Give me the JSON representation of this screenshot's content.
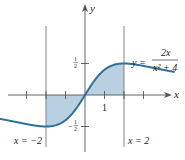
{
  "chart_data": {
    "type": "line",
    "title": "",
    "function": "y = 2x / (x^2 + 4)",
    "xlabel": "x",
    "ylabel": "y",
    "xlim": [
      -4.4,
      4.6
    ],
    "ylim": [
      -0.75,
      1.45
    ],
    "x": [
      -4.3,
      -4,
      -3.5,
      -3,
      -2.5,
      -2,
      -1.5,
      -1,
      -0.5,
      0,
      0.5,
      1,
      1.5,
      2,
      2.5,
      3,
      3.5,
      4
    ],
    "series": [
      {
        "name": "y = 2x/(x^2+4)",
        "values": [
          -0.38,
          -0.4,
          -0.43,
          -0.46,
          -0.49,
          -0.5,
          -0.48,
          -0.4,
          -0.24,
          0,
          0.24,
          0.4,
          0.48,
          0.5,
          0.49,
          0.46,
          0.43,
          0.4
        ]
      }
    ],
    "shaded_region": {
      "from_x": -2,
      "to_x": 2,
      "between": "curve and x-axis"
    },
    "vertical_lines": [
      -2,
      2
    ],
    "x_ticks": [
      -3,
      -2,
      -1,
      0,
      1,
      2,
      3
    ],
    "x_tick_labels_shown": [
      "1"
    ],
    "y_ticks": [
      0.5,
      -0.5
    ],
    "y_tick_labels": [
      "1/2",
      "-1/2"
    ],
    "grid": false
  },
  "labels": {
    "y_axis": "y",
    "x_axis": "x",
    "equation_lhs": "y =",
    "equation_num": "2x",
    "equation_den": "x² + 4",
    "y_tick_pos_num": "1",
    "y_tick_pos_den": "2",
    "y_tick_neg_sign": "−",
    "y_tick_neg_num": "1",
    "y_tick_neg_den": "2",
    "x_tick_one": "1",
    "line_left": "x = −2",
    "line_right": "x = 2"
  },
  "colors": {
    "curve": "#2f6f99",
    "fill": "#b9d0e0",
    "axis": "#555555"
  }
}
